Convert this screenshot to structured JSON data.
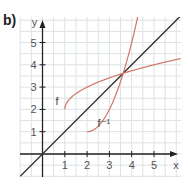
{
  "panel_label": "b)",
  "colors": {
    "grid": "#dde2e6",
    "axis": "#222222",
    "identity_line": "#333333",
    "curves": "#cf7565"
  },
  "chart_data": {
    "type": "line",
    "title": "",
    "xlabel": "x",
    "ylabel": "y",
    "xlim": [
      -1,
      6
    ],
    "ylim": [
      -1,
      6.3
    ],
    "x_ticks": [
      1,
      2,
      3,
      4,
      5
    ],
    "y_ticks": [
      1,
      2,
      3,
      4,
      5
    ],
    "grid": true,
    "grid_step": 0.5,
    "series": [
      {
        "name": "y = x",
        "label": "",
        "x": [
          -1,
          6.3
        ],
        "y": [
          -1,
          6.3
        ],
        "color": "#333333"
      },
      {
        "name": "f",
        "label": "f",
        "formula": "sqrt(x-1)+2",
        "x": [
          1,
          1.25,
          1.5,
          2,
          2.5,
          3,
          3.62,
          4,
          5,
          6
        ],
        "y": [
          2,
          2.5,
          2.71,
          3,
          3.22,
          3.41,
          3.62,
          3.73,
          4,
          4.24
        ],
        "color": "#cf7565"
      },
      {
        "name": "f^-1",
        "label": "f⁻¹",
        "formula": "(x-2)^2+1",
        "x": [
          2,
          2.5,
          3,
          3.62,
          4,
          4.35
        ],
        "y": [
          1,
          1.25,
          2,
          3.62,
          5,
          6.5
        ],
        "color": "#cf7565"
      }
    ],
    "annotations": [
      {
        "text": "f",
        "x": 0.75,
        "y": 2.3
      },
      {
        "text": "f⁻¹",
        "x": 2.35,
        "y": 1.15
      },
      {
        "text": "intersection",
        "x": 3.62,
        "y": 3.62
      }
    ]
  }
}
